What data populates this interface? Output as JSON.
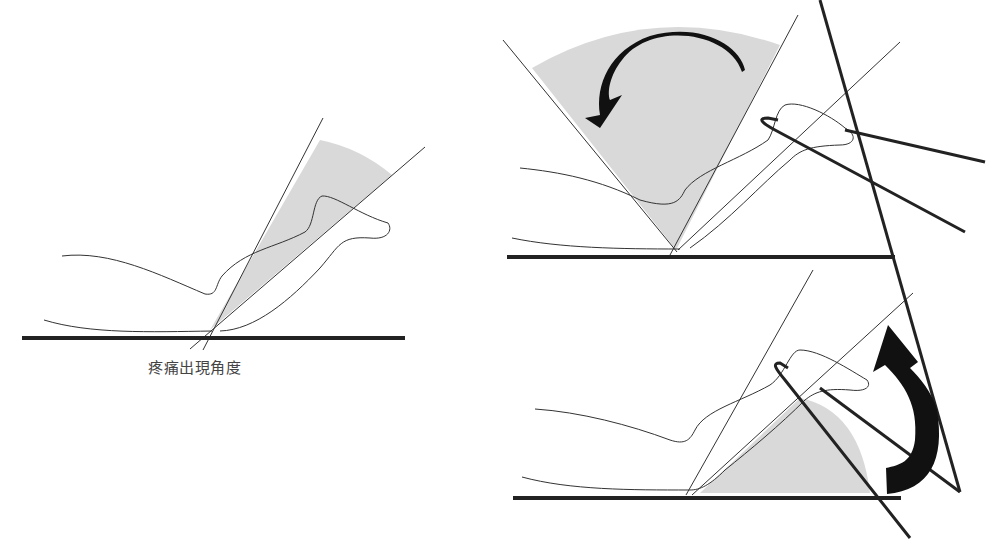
{
  "figure": {
    "panels": [
      {
        "id": "panel-pain-angle",
        "label": "疼痛出現角度"
      },
      {
        "id": "panel-dorsiflexion"
      },
      {
        "id": "panel-plantarflexion"
      }
    ]
  },
  "colors": {
    "line": "#333333",
    "ground": "#222222",
    "shade": "#d9d9d9",
    "arrow": "#111111"
  }
}
